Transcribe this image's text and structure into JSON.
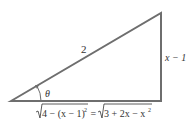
{
  "diagram": {
    "type": "right-triangle",
    "colors": {
      "stroke": "#6e6e6e",
      "text": "#333333",
      "background": "#ffffff"
    },
    "vertices": {
      "angle_vertex": [
        11,
        101
      ],
      "top_vertex": [
        161,
        13
      ],
      "right_angle_vertex": [
        161,
        101
      ]
    },
    "labels": {
      "hypotenuse": "2",
      "opposite": "x − 1",
      "angle": "θ",
      "adjacent_left": "4 − (x − 1)",
      "adjacent_left_exp": "2",
      "equals": " = ",
      "adjacent_right": "3 + 2x − x",
      "adjacent_right_exp": "2"
    }
  }
}
